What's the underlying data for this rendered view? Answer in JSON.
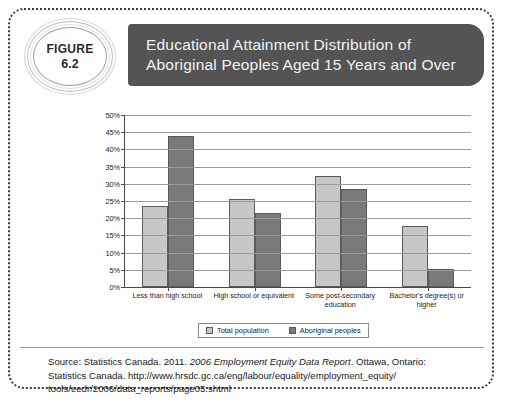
{
  "figure": {
    "badge_word": "FIGURE",
    "badge_number": "6.2",
    "title_line1": "Educational Attainment Distribution of",
    "title_line2": "Aboriginal Peoples Aged 15 Years and Over",
    "header_bg": "#545454",
    "header_text_color": "#f2f2f2"
  },
  "chart_data": {
    "type": "bar",
    "title": "Educational Attainment Distribution of Aboriginal Peoples Aged 15 Years and Over",
    "xlabel": "",
    "ylabel": "",
    "ylim": [
      0,
      50
    ],
    "grid": true,
    "legend_position": "bottom",
    "ytick_labels": [
      "50%",
      "45%",
      "40%",
      "35%",
      "30%",
      "25%",
      "20%",
      "15%",
      "10%",
      "5%",
      "0%"
    ],
    "ytick_values": [
      50,
      45,
      40,
      35,
      30,
      25,
      20,
      15,
      10,
      5,
      0
    ],
    "categories": [
      "Less than high school",
      "High school or equivalent",
      "Some post-secondary education",
      "Bachelor's degree(s) or higher"
    ],
    "category_lines": [
      [
        "Less than high school"
      ],
      [
        "High school or equivalent"
      ],
      [
        "Some post-secondary",
        "education"
      ],
      [
        "Bachelor's degree(s) or",
        "higher"
      ]
    ],
    "series": [
      {
        "name": "Total population",
        "color": "#c7c7c7",
        "values": [
          23.6,
          25.5,
          32.2,
          17.8
        ]
      },
      {
        "name": "Aboriginal peoples",
        "color": "#7a7a7a",
        "values": [
          43.8,
          21.4,
          28.6,
          5.3
        ]
      }
    ]
  },
  "source": {
    "line1_prefix": "Source: Statistics Canada. 2011. ",
    "line1_italic": "2006 Employment Equity Data Report",
    "line1_suffix": ". Ottawa, Ontario:",
    "line2": "Statistics Canada.  http://www.hrsdc.gc.ca/eng/labour/equality/employment_equity/",
    "line3": "tools/eedr/2006/data_reports/page05.shtml"
  }
}
